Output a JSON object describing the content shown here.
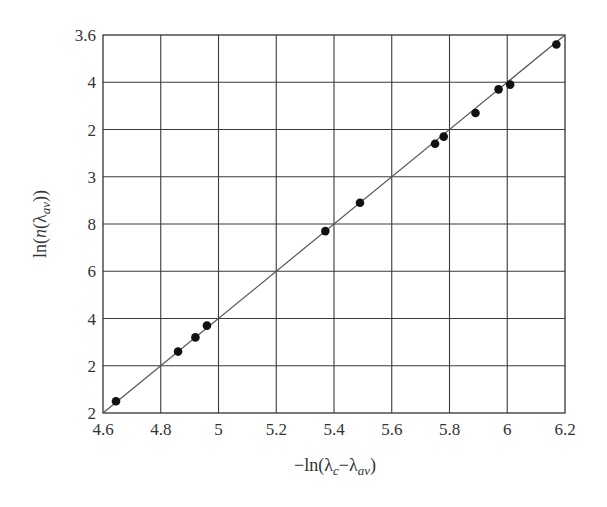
{
  "chart_data": {
    "type": "scatter",
    "title": "",
    "xlabel": "-ln(λc-λav)",
    "ylabel": "ln(n(λav))",
    "xlim": [
      4.6,
      6.2
    ],
    "ylim": [
      2.0,
      3.6
    ],
    "grid": true,
    "legend": null,
    "x_ticks": [
      "4.6",
      "4.8",
      "5",
      "5.2",
      "5.4",
      "5.6",
      "5.8",
      "6",
      "6.2"
    ],
    "y_ticks_top_to_bottom": [
      "3.6",
      "4",
      "2",
      "3",
      "8",
      "6",
      "4",
      "2",
      "2"
    ],
    "series": [
      {
        "name": "data",
        "marker": "filled-circle",
        "x": [
          4.645,
          4.86,
          4.92,
          4.96,
          5.37,
          5.49,
          5.75,
          5.78,
          5.89,
          5.97,
          6.01,
          6.17
        ],
        "y": [
          2.05,
          2.26,
          2.32,
          2.37,
          2.77,
          2.89,
          3.14,
          3.17,
          3.27,
          3.37,
          3.39,
          3.56
        ]
      },
      {
        "name": "fit",
        "type": "line",
        "x": [
          4.6,
          6.2
        ],
        "y": [
          2.0,
          3.6
        ]
      }
    ]
  },
  "axes": {
    "x_title_main": "−ln(λ",
    "x_title_sub1": "c",
    "x_title_mid": "−λ",
    "x_title_sub2": "av",
    "x_title_end": ")",
    "y_title_main": "ln(",
    "y_title_n": "n",
    "y_title_lambda": "(λ",
    "y_title_sub": "av",
    "y_title_end": "))"
  },
  "colors": {
    "grid": "#3a3a3a",
    "line": "#555555",
    "marker": "#111111"
  }
}
